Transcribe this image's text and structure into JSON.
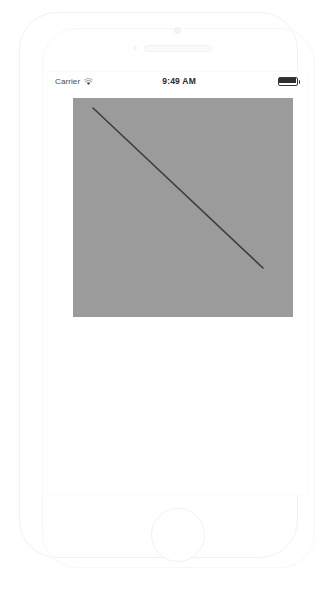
{
  "device": {
    "name": "iphone-simulator",
    "front_camera_icon": "camera-icon",
    "earpiece_icon": "speaker-icon",
    "proximity_icon": "proximity-sensor-icon",
    "home_button_label": ""
  },
  "status_bar": {
    "carrier": "Carrier",
    "wifi_icon": "wifi-icon",
    "time": "9:49 AM",
    "battery_icon": "battery-full-icon",
    "battery_level": 100
  },
  "content": {
    "canvas": {
      "name": "drawing-canvas",
      "background_color": "#9b9b9b",
      "width": 220,
      "height": 219,
      "stroke": {
        "name": "diagonal-line",
        "color": "#3d3d3d",
        "width": 1.6,
        "x1": 20,
        "y1": 10,
        "x2": 190,
        "y2": 170
      }
    }
  }
}
